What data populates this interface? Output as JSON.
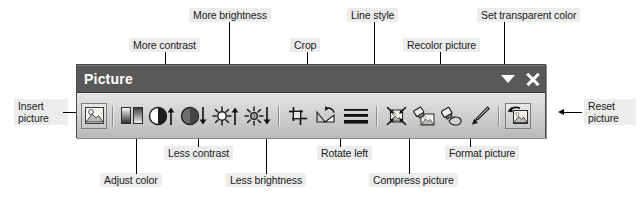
{
  "toolbar": {
    "title": "Picture",
    "window_controls": [
      {
        "name": "toolbar-options-dropdown",
        "icon": "chevron-down-icon"
      },
      {
        "name": "close-button",
        "icon": "close-icon"
      }
    ],
    "buttons": [
      {
        "id": "insert-picture",
        "icon": "insert-picture-icon",
        "tooltip": "Insert picture"
      },
      {
        "id": "color",
        "icon": "adjust-color-icon",
        "tooltip": "Adjust color"
      },
      {
        "id": "more-contrast",
        "icon": "more-contrast-icon",
        "tooltip": "More contrast"
      },
      {
        "id": "less-contrast",
        "icon": "less-contrast-icon",
        "tooltip": "Less contrast"
      },
      {
        "id": "more-brightness",
        "icon": "more-brightness-icon",
        "tooltip": "More brightness"
      },
      {
        "id": "less-brightness",
        "icon": "less-brightness-icon",
        "tooltip": "Less brightness"
      },
      {
        "id": "crop",
        "icon": "crop-icon",
        "tooltip": "Crop"
      },
      {
        "id": "rotate-left",
        "icon": "rotate-left-icon",
        "tooltip": "Rotate left"
      },
      {
        "id": "line-style",
        "icon": "line-style-icon",
        "tooltip": "Line style"
      },
      {
        "id": "compress-picture",
        "icon": "compress-picture-icon",
        "tooltip": "Compress picture"
      },
      {
        "id": "recolor-picture",
        "icon": "recolor-picture-icon",
        "tooltip": "Recolor picture"
      },
      {
        "id": "format-picture",
        "icon": "format-picture-icon",
        "tooltip": "Format picture"
      },
      {
        "id": "set-transparent-color",
        "icon": "set-transparent-color-icon",
        "tooltip": "Set transparent color"
      },
      {
        "id": "reset-picture",
        "icon": "reset-picture-icon",
        "tooltip": "Reset picture"
      }
    ]
  },
  "callouts": {
    "insert_picture": "Insert\npicture",
    "insert_picture_l1": "Insert",
    "insert_picture_l2": "picture",
    "adjust_color": "Adjust color",
    "more_contrast": "More contrast",
    "less_contrast": "Less contrast",
    "more_brightness": "More brightness",
    "less_brightness": "Less brightness",
    "crop": "Crop",
    "rotate_left": "Rotate left",
    "line_style": "Line style",
    "compress_picture": "Compress picture",
    "recolor_picture": "Recolor picture",
    "format_picture": "Format picture",
    "set_transparent_color": "Set transparent color",
    "reset_picture_l1": "Reset",
    "reset_picture_l2": "picture"
  },
  "colors": {
    "titlebar": "#595959",
    "toolbar_face": "#cfcfcf",
    "label_background": "#ececec",
    "text": "#1a1a1a",
    "title_text": "#ffffff",
    "leader_line": "#000000"
  }
}
